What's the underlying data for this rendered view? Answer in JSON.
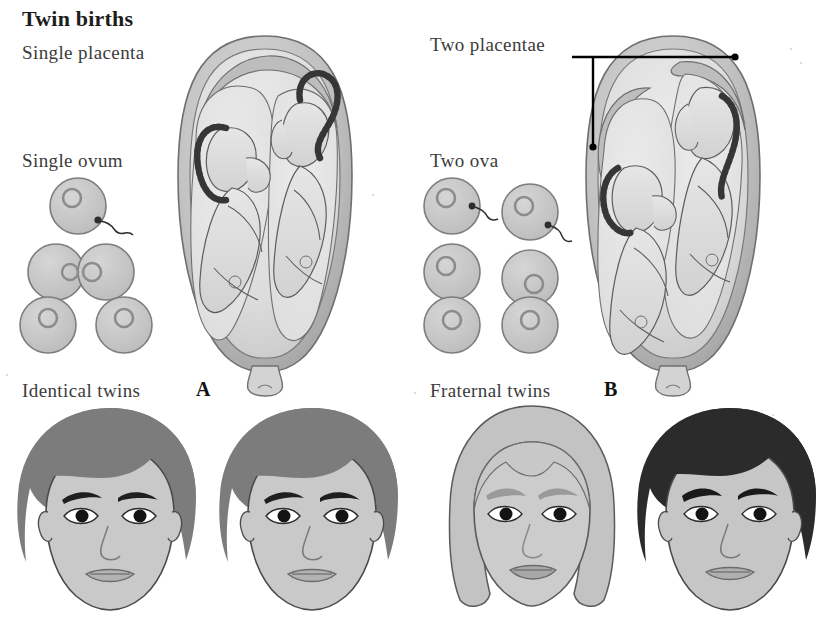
{
  "figure": {
    "title": "Twin births",
    "width": 835,
    "height": 618,
    "background": "#ffffff"
  },
  "labels": {
    "title": "Twin births",
    "single_placenta": "Single placenta",
    "single_ovum": "Single ovum",
    "two_placentae": "Two placentae",
    "two_ova": "Two ova",
    "identical_twins": "Identical twins",
    "fraternal_twins": "Fraternal twins",
    "marker_a": "A",
    "marker_b": "B"
  },
  "panels": [
    {
      "id": "A",
      "marker": "A",
      "side": "left",
      "placenta_label": "Single placenta",
      "ovum_label": "Single ovum",
      "twin_type_label": "Identical twins",
      "placenta_count": 1,
      "ovum_count": 1,
      "fetus_count": 2,
      "ovum_stages": [
        {
          "stage": "fertilized-ovum",
          "cells": 1,
          "sperm": true
        },
        {
          "stage": "dividing-ovum",
          "cells": 2,
          "sperm": false
        },
        {
          "stage": "separated-cells",
          "cells": 2,
          "sperm": false
        }
      ],
      "faces": [
        {
          "name": "identical-twin-face-1",
          "hair": "#7c7c7c",
          "skin": "#c9c9c9",
          "sex": "male",
          "hair_style": "short"
        },
        {
          "name": "identical-twin-face-2",
          "hair": "#7c7c7c",
          "skin": "#c9c9c9",
          "sex": "male",
          "hair_style": "short"
        }
      ]
    },
    {
      "id": "B",
      "marker": "B",
      "side": "right",
      "placenta_label": "Two placentae",
      "ovum_label": "Two ova",
      "twin_type_label": "Fraternal twins",
      "placenta_count": 2,
      "ovum_count": 2,
      "fetus_count": 2,
      "ovum_stages": [
        {
          "stage": "fertilized-ova",
          "cells": 2,
          "sperm": true
        },
        {
          "stage": "separate-zygotes",
          "cells": 2,
          "sperm": false
        },
        {
          "stage": "separate-cells",
          "cells": 2,
          "sperm": false
        }
      ],
      "faces": [
        {
          "name": "fraternal-twin-face-1",
          "hair": "#c3c3c3",
          "skin": "#cccccc",
          "sex": "female",
          "hair_style": "long"
        },
        {
          "name": "fraternal-twin-face-2",
          "hair": "#2b2b2b",
          "skin": "#c6c6c6",
          "sex": "male",
          "hair_style": "short"
        }
      ]
    }
  ],
  "leader_line": {
    "label": "Two placentae",
    "target_count": 2,
    "color": "#000000"
  },
  "colors": {
    "background": "#ffffff",
    "text": "#3b3b3b",
    "title_text": "#1d1d1d",
    "uterus_wall": "#b5b5b5",
    "uterus_inner": "#d8d8d8",
    "amniotic_fluid": "#e3e3e3",
    "fetus_body": "#dedede",
    "umbilical_cord": "#3a3a3a",
    "ovum_fill": "#c8c8c8",
    "ovum_outline": "#8a8a8a",
    "nucleus": "#9a9a9a",
    "outline": "#5a5a5a",
    "hair_medium": "#7c7c7c",
    "hair_dark": "#2b2b2b",
    "hair_light": "#c3c3c3",
    "skin": "#c9c9c9",
    "eye": "#1a1a1a"
  }
}
